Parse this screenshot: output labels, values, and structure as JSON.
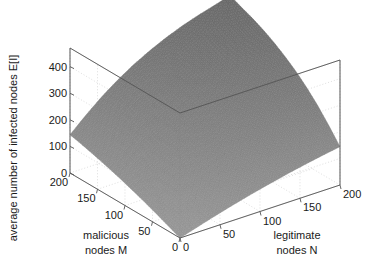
{
  "figure": {
    "kind": "matlab-3d-surface-plot",
    "background_color": "#ffffff",
    "surface_color": "#7d7d7d",
    "mesh_color": "#6a6a6a",
    "grid_color": "#c8c8c8",
    "axis_color": "#555555",
    "text_color": "#1a1a1a"
  },
  "chart_data": {
    "type": "surface",
    "title": "",
    "xlabel": "malicious nodes M",
    "ylabel": "legitimate nodes N",
    "zlabel": "average number of infected nodes E[I]",
    "xlabel_lines": [
      "malicious",
      "nodes M"
    ],
    "ylabel_lines": [
      "legitimate",
      "nodes N"
    ],
    "grid": true,
    "legend": "none",
    "xlim": [
      0,
      200
    ],
    "ylim": [
      0,
      200
    ],
    "zlim": [
      0,
      470
    ],
    "xticks": [
      200,
      150,
      100,
      50,
      0
    ],
    "yticks": [
      0,
      50,
      100,
      150,
      200
    ],
    "zticks": [
      0,
      100,
      200,
      300,
      400
    ],
    "xtick_labels": [
      "200",
      "150",
      "100",
      "50",
      "0"
    ],
    "ytick_labels": [
      "0",
      "50",
      "100",
      "150",
      "200"
    ],
    "ztick_labels": [
      "0",
      "100",
      "200",
      "300",
      "400"
    ],
    "x_axis_direction": "descending-left-to-right",
    "y_axis_direction": "ascending-left-to-right",
    "x": [
      0,
      20,
      40,
      60,
      80,
      100,
      120,
      140,
      160,
      180,
      200
    ],
    "y": [
      0,
      20,
      40,
      60,
      80,
      100,
      120,
      140,
      160,
      180,
      200
    ],
    "z": [
      [
        0,
        18,
        36,
        53,
        69,
        84,
        98,
        111,
        123,
        134,
        144
      ],
      [
        18,
        40,
        62,
        84,
        104,
        123,
        141,
        157,
        172,
        186,
        198
      ],
      [
        36,
        62,
        89,
        114,
        138,
        161,
        182,
        201,
        218,
        234,
        248
      ],
      [
        53,
        84,
        114,
        143,
        171,
        196,
        220,
        241,
        260,
        277,
        291
      ],
      [
        69,
        104,
        138,
        171,
        201,
        229,
        255,
        278,
        298,
        315,
        329
      ],
      [
        84,
        123,
        161,
        196,
        229,
        259,
        286,
        310,
        331,
        348,
        361
      ],
      [
        98,
        141,
        182,
        220,
        255,
        286,
        314,
        339,
        360,
        377,
        389
      ],
      [
        111,
        157,
        201,
        241,
        278,
        310,
        339,
        364,
        385,
        402,
        413
      ],
      [
        123,
        172,
        218,
        260,
        298,
        331,
        360,
        385,
        406,
        423,
        433
      ],
      [
        134,
        186,
        234,
        277,
        315,
        348,
        377,
        402,
        423,
        440,
        450
      ],
      [
        144,
        198,
        248,
        291,
        329,
        361,
        389,
        413,
        433,
        450,
        468
      ]
    ],
    "z_max_value": 468,
    "z_min_value": 0,
    "peak_at": {
      "malicious_nodes_M": 200,
      "legitimate_nodes_N": 200,
      "E_I": 468
    }
  },
  "projection": {
    "origin_screen": {
      "x": 180,
      "y": 238
    },
    "x_axis_end_screen": {
      "x": 70,
      "y": 173
    },
    "y_axis_end_screen": {
      "x": 340,
      "y": 185
    },
    "z_axis_top_screen": {
      "x": 180,
      "y": 113
    }
  }
}
